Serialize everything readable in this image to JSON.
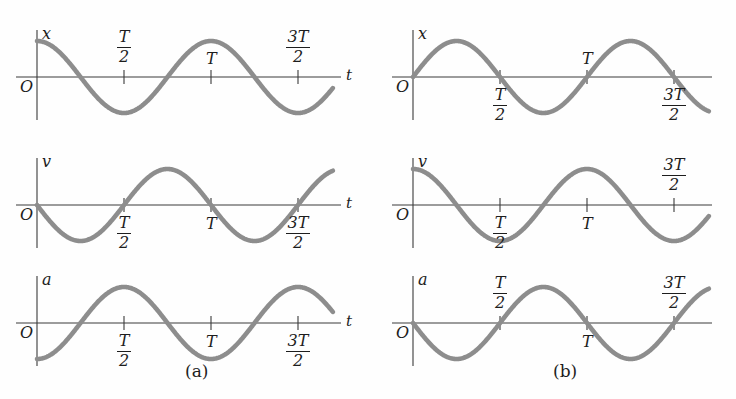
{
  "figure": {
    "width": 736,
    "height": 399,
    "background": "#fefefe",
    "curve_color": "#8d8d8d",
    "axis_color": "#3a3a3a",
    "text_color": "#1d1d1d",
    "curve_width": 4.6,
    "axis_width": 1.1
  },
  "labels": {
    "origin": "O",
    "t_axis": "t",
    "x_axis": "x",
    "v_axis": "v",
    "a_axis": "a",
    "T": "T",
    "three": "3",
    "two": "2",
    "caption_a": "(a)",
    "caption_b": "(b)"
  },
  "captions": [
    {
      "text": "(a)",
      "x": 185,
      "y": 363
    },
    {
      "text": "(b)",
      "x": 553,
      "y": 363
    }
  ],
  "chart_data": {
    "type": "line",
    "xlabel": "t",
    "x_range_periods": [
      0,
      1.7
    ],
    "xticks": [
      "T/2",
      "T",
      "3T/2"
    ],
    "xtick_periods": [
      0.5,
      1.0,
      1.5
    ],
    "grid": false,
    "legend": false,
    "panels": [
      {
        "id": "a-x",
        "group": "(a)",
        "ylabel": "x",
        "xlabel": "t",
        "show_t_label": true,
        "formula": "x = A cos(2*pi*t/T)",
        "phase": "cos",
        "amplitude": 1,
        "start_value": 1,
        "tick_label_side": "above",
        "ticks": [
          {
            "label": "T/2",
            "numerator": "T",
            "denominator": "2",
            "period": 0.5
          },
          {
            "label": "T",
            "numerator": "T",
            "denominator": "",
            "period": 1.0
          },
          {
            "label": "3T/2",
            "numerator": "3T",
            "denominator": "2",
            "period": 1.5
          }
        ],
        "samples_periods": [
          0,
          0.25,
          0.5,
          0.75,
          1.0,
          1.25,
          1.5,
          1.7
        ],
        "samples_values": [
          1,
          0,
          -1,
          0,
          1,
          0,
          -1,
          -0.81
        ]
      },
      {
        "id": "a-v",
        "group": "(a)",
        "ylabel": "v",
        "xlabel": "t",
        "show_t_label": true,
        "formula": "v = -A*omega sin(2*pi*t/T)",
        "phase": "-sin",
        "amplitude": 1,
        "start_value": 0,
        "tick_label_side": "below",
        "ticks": [
          {
            "label": "T/2",
            "numerator": "T",
            "denominator": "2",
            "period": 0.5
          },
          {
            "label": "T",
            "numerator": "T",
            "denominator": "",
            "period": 1.0
          },
          {
            "label": "3T/2",
            "numerator": "3T",
            "denominator": "2",
            "period": 1.5
          }
        ],
        "samples_periods": [
          0,
          0.25,
          0.5,
          0.75,
          1.0,
          1.25,
          1.5,
          1.7
        ],
        "samples_values": [
          0,
          -1,
          0,
          1,
          0,
          -1,
          0,
          0.95
        ]
      },
      {
        "id": "a-a",
        "group": "(a)",
        "ylabel": "a",
        "xlabel": "t",
        "show_t_label": true,
        "formula": "a = -A*omega^2 cos(2*pi*t/T)",
        "phase": "-cos",
        "amplitude": 1,
        "start_value": -1,
        "tick_label_side": "below",
        "ticks": [
          {
            "label": "T/2",
            "numerator": "T",
            "denominator": "2",
            "period": 0.5
          },
          {
            "label": "T",
            "numerator": "T",
            "denominator": "",
            "period": 1.0
          },
          {
            "label": "3T/2",
            "numerator": "3T",
            "denominator": "2",
            "period": 1.5
          }
        ],
        "samples_periods": [
          0,
          0.25,
          0.5,
          0.75,
          1.0,
          1.25,
          1.5,
          1.7
        ],
        "samples_values": [
          -1,
          0,
          1,
          0,
          -1,
          0,
          1,
          0.81
        ]
      },
      {
        "id": "b-x",
        "group": "(b)",
        "ylabel": "x",
        "xlabel": "",
        "show_t_label": false,
        "formula": "x = A sin(2*pi*t/T)",
        "phase": "sin",
        "amplitude": 1,
        "start_value": 0,
        "tick_label_side": "below",
        "ticks": [
          {
            "label": "T/2",
            "numerator": "T",
            "denominator": "2",
            "period": 0.5
          },
          {
            "label": "T",
            "numerator": "T",
            "denominator": "",
            "period": 1.0,
            "side": "above"
          },
          {
            "label": "3T/2",
            "numerator": "3T",
            "denominator": "2",
            "period": 1.5
          }
        ],
        "samples_periods": [
          0,
          0.25,
          0.5,
          0.75,
          1.0,
          1.25,
          1.5,
          1.7
        ],
        "samples_values": [
          0,
          1,
          0,
          -1,
          0,
          1,
          0,
          -0.95
        ]
      },
      {
        "id": "b-v",
        "group": "(b)",
        "ylabel": "v",
        "xlabel": "",
        "show_t_label": false,
        "formula": "v = A*omega cos(2*pi*t/T)",
        "phase": "cos",
        "amplitude": 1,
        "start_value": 1,
        "tick_label_side": "below",
        "ticks": [
          {
            "label": "T/2",
            "numerator": "T",
            "denominator": "2",
            "period": 0.5
          },
          {
            "label": "T",
            "numerator": "T",
            "denominator": "",
            "period": 1.0
          },
          {
            "label": "3T/2",
            "numerator": "3T",
            "denominator": "2",
            "period": 1.5,
            "side": "above"
          }
        ],
        "samples_periods": [
          0,
          0.25,
          0.5,
          0.75,
          1.0,
          1.25,
          1.5,
          1.7
        ],
        "samples_values": [
          1,
          0,
          -1,
          0,
          1,
          0,
          -1,
          -0.81
        ]
      },
      {
        "id": "b-a",
        "group": "(b)",
        "ylabel": "a",
        "xlabel": "",
        "show_t_label": false,
        "formula": "a = -A*omega^2 sin(2*pi*t/T)",
        "phase": "-sin",
        "amplitude": 1,
        "start_value": 0,
        "tick_label_side": "above",
        "ticks": [
          {
            "label": "T/2",
            "numerator": "T",
            "denominator": "2",
            "period": 0.5
          },
          {
            "label": "T",
            "numerator": "T",
            "denominator": "",
            "period": 1.0,
            "side": "below"
          },
          {
            "label": "3T/2",
            "numerator": "3T",
            "denominator": "2",
            "period": 1.5
          }
        ],
        "samples_periods": [
          0,
          0.25,
          0.5,
          0.75,
          1.0,
          1.25,
          1.5,
          1.7
        ],
        "samples_values": [
          0,
          -1,
          0,
          1,
          0,
          -1,
          0,
          0.95
        ]
      }
    ]
  }
}
